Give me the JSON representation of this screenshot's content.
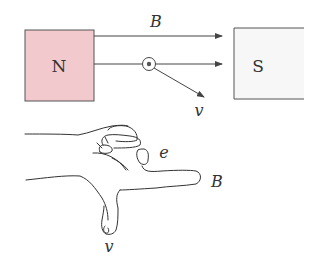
{
  "diagram": {
    "north_pole": {
      "label": "N",
      "fill": "#f2c9cc"
    },
    "south_pole": {
      "label": "S",
      "fill": "#f7f7f7"
    },
    "field_label": "B",
    "velocity_label": "v",
    "hand": {
      "electron_label": "e",
      "index_finger_label": "B",
      "thumb_label": "v"
    }
  }
}
